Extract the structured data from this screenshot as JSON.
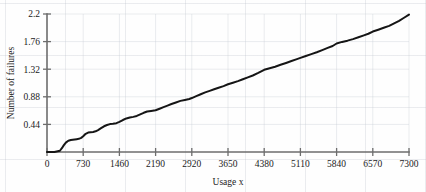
{
  "chart_data": {
    "type": "line",
    "title": "",
    "xlabel": "Usage x",
    "ylabel": "Number of failures",
    "xlim": [
      0,
      7300
    ],
    "ylim": [
      0,
      2.2
    ],
    "xticks": [
      0,
      730,
      1460,
      2190,
      2920,
      3650,
      4380,
      5110,
      5840,
      6570,
      7300
    ],
    "xticklabels": [
      "0",
      "730",
      "1460",
      "2190",
      "2920",
      "3650",
      "4380",
      "5110",
      "5840",
      "6570",
      "7300"
    ],
    "yticks": [
      0.44,
      0.88,
      1.32,
      1.76,
      2.2
    ],
    "yticklabels": [
      "0.44",
      "0.88",
      "1.32",
      "1.76",
      "2.2"
    ],
    "grid": false,
    "legend": null,
    "series": [
      {
        "name": "Cumulative number of failures",
        "style": "step-staircase",
        "color": "#151515",
        "x": [
          0,
          150,
          260,
          300,
          340,
          380,
          430,
          480,
          520,
          560,
          600,
          640,
          690,
          730,
          780,
          830,
          880,
          930,
          980,
          1030,
          1090,
          1150,
          1210,
          1270,
          1330,
          1400,
          1460,
          1530,
          1600,
          1670,
          1740,
          1810,
          1880,
          1950,
          2020,
          2100,
          2190,
          2270,
          2350,
          2430,
          2510,
          2600,
          2690,
          2780,
          2870,
          2920,
          3010,
          3100,
          3190,
          3280,
          3370,
          3460,
          3560,
          3650,
          3750,
          3850,
          3950,
          4050,
          4150,
          4260,
          4380,
          4490,
          4600,
          4710,
          4820,
          4930,
          5040,
          5110,
          5220,
          5330,
          5440,
          5550,
          5660,
          5760,
          5840,
          5950,
          6060,
          6170,
          6280,
          6390,
          6480,
          6570,
          6680,
          6790,
          6900,
          7000,
          7100,
          7200,
          7300
        ],
        "y": [
          0.0,
          0.0,
          0.02,
          0.06,
          0.11,
          0.15,
          0.18,
          0.19,
          0.195,
          0.2,
          0.205,
          0.21,
          0.225,
          0.25,
          0.29,
          0.31,
          0.315,
          0.32,
          0.33,
          0.35,
          0.38,
          0.41,
          0.43,
          0.445,
          0.45,
          0.46,
          0.48,
          0.51,
          0.535,
          0.55,
          0.56,
          0.575,
          0.6,
          0.625,
          0.645,
          0.655,
          0.665,
          0.69,
          0.715,
          0.74,
          0.765,
          0.79,
          0.815,
          0.83,
          0.845,
          0.86,
          0.89,
          0.92,
          0.95,
          0.975,
          1.0,
          1.025,
          1.05,
          1.08,
          1.105,
          1.13,
          1.16,
          1.19,
          1.22,
          1.26,
          1.31,
          1.335,
          1.36,
          1.39,
          1.42,
          1.45,
          1.48,
          1.5,
          1.53,
          1.56,
          1.59,
          1.625,
          1.66,
          1.69,
          1.73,
          1.755,
          1.775,
          1.8,
          1.83,
          1.86,
          1.885,
          1.92,
          1.95,
          1.98,
          2.01,
          2.05,
          2.09,
          2.14,
          2.19
        ]
      }
    ]
  }
}
